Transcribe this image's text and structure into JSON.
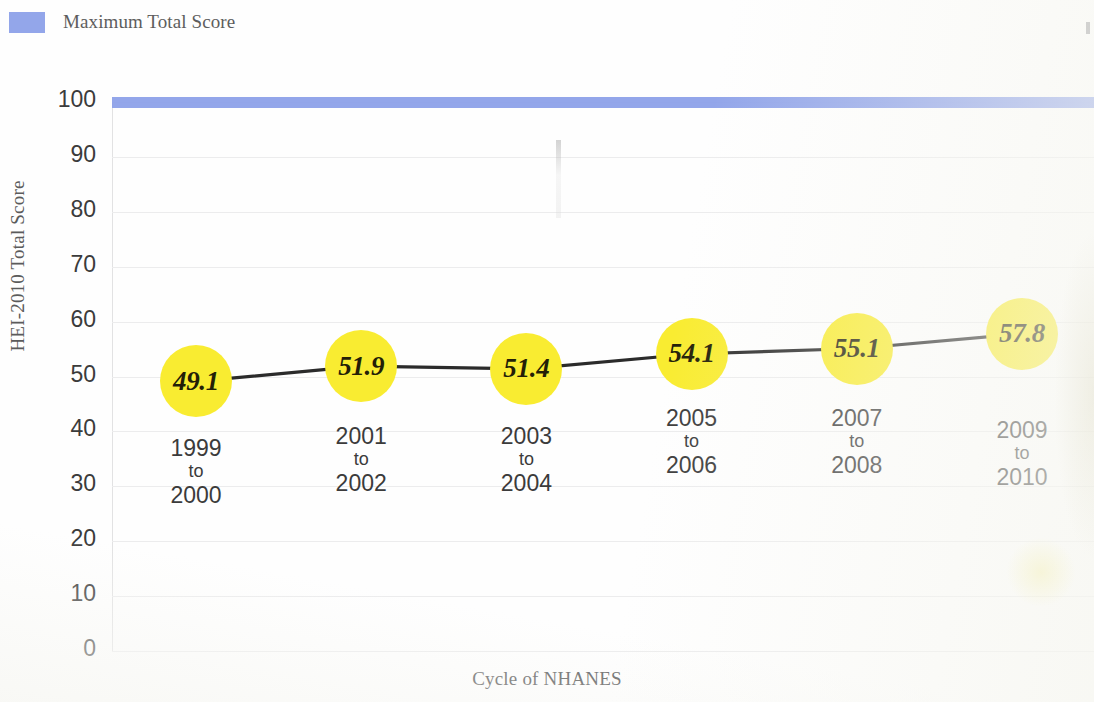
{
  "legend": {
    "items": [
      {
        "label": "Maximum Total Score",
        "color": "#8b9fe8",
        "swatch_icon": "legend-swatch-icon"
      }
    ]
  },
  "axes": {
    "y_title": "HEI-2010 Total Score",
    "x_title": "Cycle of NHANES",
    "y_ticks": [
      "100",
      "90",
      "80",
      "70",
      "60",
      "50",
      "40",
      "30",
      "20",
      "10",
      "0"
    ]
  },
  "chart_data": {
    "type": "line",
    "title": "",
    "subtitle": "",
    "xlabel": "Cycle of NHANES",
    "ylabel": "HEI-2010 Total Score",
    "ylim": [
      0,
      100
    ],
    "ytick_step": 10,
    "grid": true,
    "legend_position": "top-left",
    "categories": [
      "1999 to 2000",
      "2001 to 2002",
      "2003 to 2004",
      "2005 to 2006",
      "2007 to 2008",
      "2009 to 2010"
    ],
    "category_lines": [
      {
        "start": "1999",
        "mid": "to",
        "end": "2000"
      },
      {
        "start": "2001",
        "mid": "to",
        "end": "2002"
      },
      {
        "start": "2003",
        "mid": "to",
        "end": "2004"
      },
      {
        "start": "2005",
        "mid": "to",
        "end": "2006"
      },
      {
        "start": "2007",
        "mid": "to",
        "end": "2008"
      },
      {
        "start": "2009",
        "mid": "to",
        "end": "2010"
      }
    ],
    "series": [
      {
        "name": "HEI-2010 Total Score",
        "marker": "bubble",
        "marker_color": "#f9ec31",
        "line_color": "#2b2b2b",
        "values": [
          49.1,
          51.9,
          51.4,
          54.1,
          55.1,
          57.8
        ],
        "labels": [
          "49.1",
          "51.9",
          "51.4",
          "54.1",
          "55.1",
          "57.8"
        ]
      },
      {
        "name": "Maximum Total Score",
        "marker": "none",
        "line_color": "#8b9fe8",
        "values": [
          100,
          100,
          100,
          100,
          100,
          100
        ],
        "labels": [
          "",
          "",
          "",
          "",
          "",
          ""
        ]
      }
    ]
  }
}
